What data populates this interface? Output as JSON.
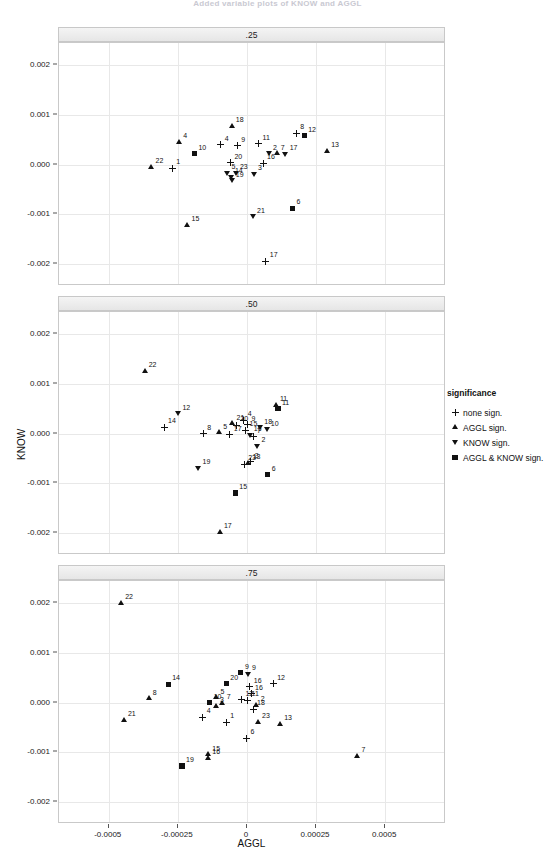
{
  "figure": {
    "title": "Added variable plots of KNOW and AGGL",
    "xlabel": "AGGL",
    "ylabel": "KNOW"
  },
  "legend": {
    "title": "significance",
    "items": [
      {
        "label": "none sign.",
        "marker": "plus"
      },
      {
        "label": "AGGL sign.",
        "marker": "up"
      },
      {
        "label": "KNOW sign.",
        "marker": "down"
      },
      {
        "label": "AGGL & KNOW sign.",
        "marker": "square"
      }
    ]
  },
  "chart_data": {
    "type": "scatter",
    "title": "Added variable plots of KNOW and AGGL",
    "xlabel": "AGGL",
    "ylabel": "KNOW",
    "xlim": [
      -0.00068,
      0.00072
    ],
    "ylim": [
      -0.00245,
      0.00245
    ],
    "xticks": [
      -0.0005,
      -0.00025,
      0,
      0.00025,
      0.0005
    ],
    "xticklabels": [
      "-0.0005",
      "-0.00025",
      "0",
      "0.00025",
      "0.0005"
    ],
    "yticks": [
      0.002,
      0.001,
      0,
      -0.001,
      -0.002
    ],
    "yticklabels": [
      "0.002",
      "0.001",
      "0.000",
      "-0.001",
      "-0.002"
    ],
    "grid": true,
    "legend_position": "right",
    "facet_variable": "quantile",
    "marker_legend": {
      "plus": "none sign.",
      "up": "AGGL sign.",
      "down": "KNOW sign.",
      "square": "AGGL & KNOW sign."
    },
    "panels": [
      {
        "strip": ".25",
        "points": [
          {
            "id": "18",
            "x": -5.5e-05,
            "y": 0.00078,
            "marker": "up"
          },
          {
            "id": "8",
            "x": 0.000178,
            "y": 0.00063,
            "marker": "plus"
          },
          {
            "id": "12",
            "x": 0.000207,
            "y": 0.00058,
            "marker": "square"
          },
          {
            "id": "4",
            "x": -0.000245,
            "y": 0.00046,
            "marker": "up"
          },
          {
            "id": "4",
            "x": -9.5e-05,
            "y": 0.0004,
            "marker": "plus"
          },
          {
            "id": "9",
            "x": -3.5e-05,
            "y": 0.00038,
            "marker": "plus"
          },
          {
            "id": "11",
            "x": 4.2e-05,
            "y": 0.00042,
            "marker": "plus"
          },
          {
            "id": "13",
            "x": 0.00029,
            "y": 0.00027,
            "marker": "up"
          },
          {
            "id": "2",
            "x": 8e-05,
            "y": 0.00022,
            "marker": "down"
          },
          {
            "id": "7",
            "x": 0.000108,
            "y": 0.00022,
            "marker": "up"
          },
          {
            "id": "17",
            "x": 0.00014,
            "y": 0.00021,
            "marker": "down"
          },
          {
            "id": "10",
            "x": -0.00019,
            "y": 0.00022,
            "marker": "square"
          },
          {
            "id": "20",
            "x": -6e-05,
            "y": 4e-05,
            "marker": "plus"
          },
          {
            "id": "16",
            "x": 5.8e-05,
            "y": 3e-05,
            "marker": "plus"
          },
          {
            "id": "22",
            "x": -0.000345,
            "y": -5e-05,
            "marker": "up"
          },
          {
            "id": "1",
            "x": -0.00027,
            "y": -8e-05,
            "marker": "plus"
          },
          {
            "id": "5",
            "x": -7e-05,
            "y": -0.00017,
            "marker": "down"
          },
          {
            "id": "23",
            "x": -4e-05,
            "y": -0.00017,
            "marker": "down"
          },
          {
            "id": "3",
            "x": 2.5e-05,
            "y": -0.0002,
            "marker": "down"
          },
          {
            "id": "14",
            "x": -5.8e-05,
            "y": -0.00025,
            "marker": "down"
          },
          {
            "id": "19",
            "x": -5.5e-05,
            "y": -0.00033,
            "marker": "down"
          },
          {
            "id": "6",
            "x": 0.000165,
            "y": -0.00088,
            "marker": "square"
          },
          {
            "id": "21",
            "x": 2.2e-05,
            "y": -0.00105,
            "marker": "down"
          },
          {
            "id": "15",
            "x": -0.000215,
            "y": -0.00122,
            "marker": "up"
          },
          {
            "id": "17",
            "x": 6.8e-05,
            "y": -0.00195,
            "marker": "plus"
          }
        ]
      },
      {
        "strip": ".50",
        "points": [
          {
            "id": "22",
            "x": -0.00037,
            "y": 0.00126,
            "marker": "up"
          },
          {
            "id": "11",
            "x": 0.000105,
            "y": 0.00057,
            "marker": "up"
          },
          {
            "id": "11",
            "x": 0.000112,
            "y": 0.0005,
            "marker": "square"
          },
          {
            "id": "12",
            "x": -0.000248,
            "y": 0.0004,
            "marker": "down"
          },
          {
            "id": "4",
            "x": -1.2e-05,
            "y": 0.00027,
            "marker": "plus"
          },
          {
            "id": "21",
            "x": -5.2e-05,
            "y": 0.0002,
            "marker": "up"
          },
          {
            "id": "20",
            "x": -3.8e-05,
            "y": 0.00017,
            "marker": "plus"
          },
          {
            "id": "9",
            "x": 2e-06,
            "y": 0.00018,
            "marker": "plus"
          },
          {
            "id": "14",
            "x": -0.0003,
            "y": 0.00013,
            "marker": "plus"
          },
          {
            "id": "18",
            "x": 4.8e-05,
            "y": 0.00012,
            "marker": "down"
          },
          {
            "id": "10",
            "x": 7.2e-05,
            "y": 8e-05,
            "marker": "down"
          },
          {
            "id": "15",
            "x": -5e-06,
            "y": 7e-05,
            "marker": "plus"
          },
          {
            "id": "5",
            "x": -0.0001,
            "y": 2e-05,
            "marker": "up"
          },
          {
            "id": "8",
            "x": -0.000158,
            "y": 0.0,
            "marker": "plus"
          },
          {
            "id": "17",
            "x": -6.2e-05,
            "y": -3e-05,
            "marker": "plus"
          },
          {
            "id": "16",
            "x": 1e-05,
            "y": -4e-05,
            "marker": "down"
          },
          {
            "id": "7",
            "x": 2.2e-05,
            "y": -7e-05,
            "marker": "plus"
          },
          {
            "id": "2",
            "x": 3.8e-05,
            "y": -0.00026,
            "marker": "down"
          },
          {
            "id": "13",
            "x": 6e-06,
            "y": -0.0006,
            "marker": "up"
          },
          {
            "id": "3",
            "x": 1.4e-05,
            "y": -0.00057,
            "marker": "plus"
          },
          {
            "id": "23",
            "x": -1e-05,
            "y": -0.00062,
            "marker": "plus"
          },
          {
            "id": "19",
            "x": -0.000175,
            "y": -0.0007,
            "marker": "down"
          },
          {
            "id": "6",
            "x": 7.5e-05,
            "y": -0.00083,
            "marker": "square"
          },
          {
            "id": "15",
            "x": -4.2e-05,
            "y": -0.0012,
            "marker": "square"
          },
          {
            "id": "17",
            "x": -9.8e-05,
            "y": -0.00198,
            "marker": "up"
          }
        ]
      },
      {
        "strip": ".75",
        "points": [
          {
            "id": "22",
            "x": -0.000455,
            "y": 0.002,
            "marker": "up"
          },
          {
            "id": "9",
            "x": -2.2e-05,
            "y": 0.0006,
            "marker": "square"
          },
          {
            "id": "9",
            "x": 4e-06,
            "y": 0.00057,
            "marker": "down"
          },
          {
            "id": "14",
            "x": -0.000285,
            "y": 0.00037,
            "marker": "square"
          },
          {
            "id": "20",
            "x": -7.5e-05,
            "y": 0.00038,
            "marker": "square"
          },
          {
            "id": "12",
            "x": 9.5e-05,
            "y": 0.00038,
            "marker": "plus"
          },
          {
            "id": "16",
            "x": 1e-05,
            "y": 0.00032,
            "marker": "plus"
          },
          {
            "id": "16",
            "x": 1.5e-05,
            "y": 0.00018,
            "marker": "plus"
          },
          {
            "id": "8",
            "x": -0.000355,
            "y": 8e-05,
            "marker": "up"
          },
          {
            "id": "5",
            "x": -0.00011,
            "y": 0.0001,
            "marker": "up"
          },
          {
            "id": "12",
            "x": -2e-05,
            "y": 6e-05,
            "marker": "plus"
          },
          {
            "id": "11",
            "x": 2e-06,
            "y": 5e-05,
            "marker": "plus"
          },
          {
            "id": "10",
            "x": -0.000135,
            "y": 0.0,
            "marker": "square"
          },
          {
            "id": "7",
            "x": -8.8e-05,
            "y": -2e-05,
            "marker": "up"
          },
          {
            "id": "3",
            "x": -0.000112,
            "y": -8e-05,
            "marker": "up"
          },
          {
            "id": "2",
            "x": 3.5e-05,
            "y": -5e-05,
            "marker": "up"
          },
          {
            "id": "18",
            "x": 2.2e-05,
            "y": -0.00014,
            "marker": "plus"
          },
          {
            "id": "4",
            "x": -0.00016,
            "y": -0.0003,
            "marker": "plus"
          },
          {
            "id": "1",
            "x": -7.5e-05,
            "y": -0.0004,
            "marker": "plus"
          },
          {
            "id": "23",
            "x": 4e-05,
            "y": -0.0004,
            "marker": "up"
          },
          {
            "id": "13",
            "x": 0.00012,
            "y": -0.00044,
            "marker": "up"
          },
          {
            "id": "21",
            "x": -0.000445,
            "y": -0.00035,
            "marker": "up"
          },
          {
            "id": "6",
            "x": -2e-06,
            "y": -0.00072,
            "marker": "plus"
          },
          {
            "id": "7",
            "x": 0.0004,
            "y": -0.00108,
            "marker": "up"
          },
          {
            "id": "15",
            "x": -0.00014,
            "y": -0.00105,
            "marker": "up"
          },
          {
            "id": "16",
            "x": -0.00014,
            "y": -0.00112,
            "marker": "up"
          },
          {
            "id": "19",
            "x": -0.000235,
            "y": -0.00128,
            "marker": "square"
          }
        ]
      }
    ]
  }
}
